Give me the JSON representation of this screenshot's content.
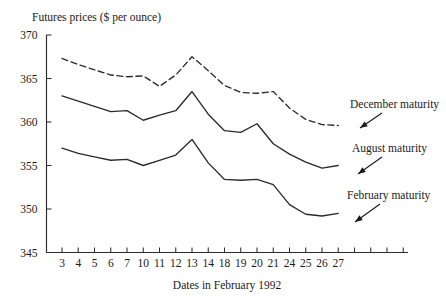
{
  "chart_data": {
    "type": "line",
    "title": "Futures prices ($ per ounce)",
    "xlabel": "Dates in February 1992",
    "ylabel": "",
    "grid": false,
    "legend_position": "inline-annotations",
    "xlim": [
      0,
      26
    ],
    "ylim": [
      345,
      370
    ],
    "y_ticks": [
      345,
      350,
      355,
      360,
      365,
      370
    ],
    "x_tick_labels": [
      "3",
      "4",
      "5",
      "6",
      "7",
      "10",
      "11",
      "12",
      "13",
      "14",
      "18",
      "19",
      "20",
      "21",
      "24",
      "25",
      "26",
      "27",
      "",
      "",
      "",
      ""
    ],
    "categories": [
      "3",
      "4",
      "5",
      "6",
      "7",
      "10",
      "11",
      "12",
      "13",
      "14",
      "18",
      "19",
      "20",
      "21",
      "24",
      "25",
      "26",
      "27"
    ],
    "series": [
      {
        "name": "December maturity",
        "style": "dashed",
        "color": "#2b2b2b",
        "values": [
          367.3,
          366.6,
          366.0,
          365.4,
          365.2,
          365.3,
          364.1,
          365.4,
          367.5,
          365.9,
          364.2,
          363.4,
          363.3,
          363.5,
          361.6,
          360.3,
          359.7,
          359.6
        ]
      },
      {
        "name": "August maturity",
        "style": "solid",
        "color": "#2b2b2b",
        "values": [
          363.0,
          362.4,
          361.8,
          361.2,
          361.3,
          360.2,
          360.8,
          361.3,
          363.5,
          360.9,
          359.0,
          358.8,
          359.8,
          357.5,
          356.3,
          355.4,
          354.7,
          355.0
        ]
      },
      {
        "name": "February maturity",
        "style": "solid",
        "color": "#2b2b2b",
        "values": [
          357.0,
          356.4,
          356.0,
          355.6,
          355.7,
          355.0,
          355.6,
          356.2,
          358.0,
          355.3,
          353.4,
          353.3,
          353.4,
          352.8,
          350.5,
          349.4,
          349.2,
          349.5
        ]
      }
    ],
    "annotations": [
      {
        "text": "December maturity",
        "target_series": "December maturity"
      },
      {
        "text": "August maturity",
        "target_series": "August maturity"
      },
      {
        "text": "February maturity",
        "target_series": "February maturity"
      }
    ]
  }
}
